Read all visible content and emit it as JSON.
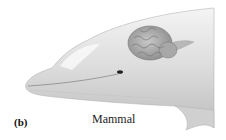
{
  "figure": {
    "panel_label": "(b)",
    "caption": "Mammal"
  }
}
